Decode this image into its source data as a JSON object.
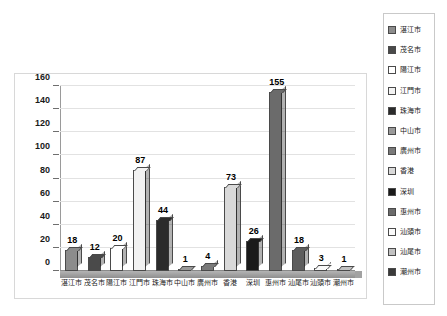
{
  "chart_data": {
    "type": "bar",
    "title": "",
    "subtitle": "",
    "xlabel": "",
    "ylabel": "",
    "ylim": [
      0,
      160
    ],
    "ytick_step": 20,
    "ytick_labels": [
      "160",
      "140",
      "120",
      "100",
      "80",
      "60",
      "40",
      "20",
      "0"
    ],
    "grid": true,
    "legend_position": "right",
    "categories": [
      "湛江市",
      "茂名市",
      "陽江市",
      "江門市",
      "珠海市",
      "中山市",
      "廣州市",
      "香港",
      "深圳",
      "惠州市",
      "汕尾市",
      "汕頭市",
      "潮州市"
    ],
    "values": [
      18,
      12,
      20,
      87,
      44,
      1,
      4,
      73,
      26,
      155,
      18,
      3,
      1
    ],
    "colors": [
      "#8c8c8c",
      "#4a4a4a",
      "#ffffff",
      "#f2f2f2",
      "#2b2b2b",
      "#9a9a9a",
      "#7a7a7a",
      "#d9d9d9",
      "#1a1a1a",
      "#6b6b6b",
      "#5e5e5e",
      "#fafafa",
      "#c2c2c2"
    ],
    "series": [
      {
        "name": "城市數量",
        "values": [
          18,
          12,
          20,
          87,
          44,
          1,
          4,
          73,
          26,
          155,
          18,
          3,
          1
        ]
      }
    ]
  },
  "legend": {
    "items": [
      {
        "label": "湛江市",
        "color": "#8c8c8c"
      },
      {
        "label": "茂名市",
        "color": "#4a4a4a"
      },
      {
        "label": "陽江市",
        "color": "#ffffff"
      },
      {
        "label": "江門市",
        "color": "#f2f2f2"
      },
      {
        "label": "珠海市",
        "color": "#2b2b2b"
      },
      {
        "label": "中山市",
        "color": "#9a9a9a"
      },
      {
        "label": "廣州市",
        "color": "#7a7a7a"
      },
      {
        "label": "香港",
        "color": "#d9d9d9"
      },
      {
        "label": "深圳",
        "color": "#1a1a1a"
      },
      {
        "label": "惠州市",
        "color": "#6b6b6b"
      },
      {
        "label": "汕頭市",
        "color": "#fafafa"
      },
      {
        "label": "汕尾市",
        "color": "#c2c2c2"
      },
      {
        "label": "潮州市",
        "color": "#3a3a3a"
      }
    ]
  },
  "colors": {
    "plot_background": "#ffffff",
    "frame_border": "#d8d8d8",
    "gridline": "#e2e2e2",
    "axis": "#9a9a9a",
    "floor": "#a2a2a2",
    "text": "#1a1a1a"
  }
}
